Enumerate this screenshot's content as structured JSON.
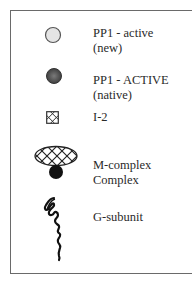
{
  "legend": {
    "items": [
      {
        "icon": "circle-light-icon",
        "line1": "PP1 - active",
        "line2": "(new)"
      },
      {
        "icon": "circle-dark-icon",
        "line1": "PP1 - ACTIVE",
        "line2": "(native)"
      },
      {
        "icon": "crosshatch-square-icon",
        "line1": "I-2",
        "line2": ""
      },
      {
        "icon": "crosshatch-ellipse-with-dot-icon",
        "line1": "M-complex",
        "line2": "Complex"
      },
      {
        "icon": "squiggle-chain-icon",
        "line1": "G-subunit",
        "line2": ""
      }
    ]
  },
  "colors": {
    "light_circle_fill": "#e4e4e4",
    "dark_circle_fill": "#555555",
    "border": "#6a6a6a",
    "ink": "#111111"
  }
}
